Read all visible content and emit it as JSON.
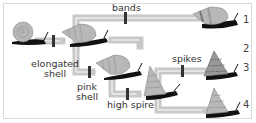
{
  "diagram": {
    "title": "",
    "traits": {
      "bands": "bands",
      "elongated_line1": "elongated",
      "elongated_line2": "shell",
      "pink_line1": "pink",
      "pink_line2": "shell",
      "spikes": "spikes",
      "high_spire": "high spire"
    },
    "outcomes": [
      "1",
      "2",
      "3",
      "4"
    ],
    "colors": {
      "path": "#c8c8c8",
      "path_inner": "#ffffff",
      "marker": "#333333",
      "shell": "#b5b5b5",
      "body": "#111111",
      "frame": "#d9d9d9"
    },
    "nodes": [
      {
        "id": "ancestor",
        "shape": "round-shell"
      },
      {
        "id": "elongated",
        "shape": "elongated-shell"
      },
      {
        "id": "pink",
        "shape": "elongated-shell"
      },
      {
        "id": "outcome-1",
        "shape": "banded-elongated-shell"
      },
      {
        "id": "outcome-3",
        "shape": "spiked-high-spire"
      },
      {
        "id": "high-spire",
        "shape": "high-spire"
      },
      {
        "id": "outcome-4",
        "shape": "high-spire"
      }
    ]
  }
}
